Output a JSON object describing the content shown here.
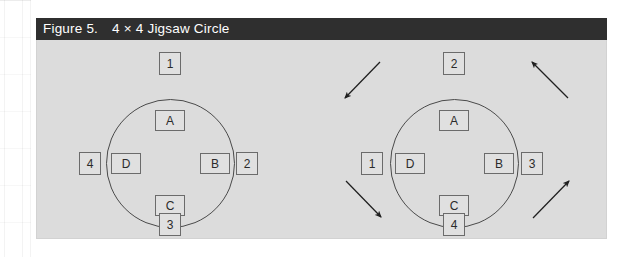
{
  "figure": {
    "label": "Figure 5.",
    "title": "4 × 4 Jigsaw Circle",
    "header_bg": "#2f2f2f",
    "header_fg": "#ffffff",
    "panel_bg": "#dcdcdc",
    "box_bg": "#e0e0e0",
    "line_color": "#4a4a4a"
  },
  "diagrams": [
    {
      "name": "before",
      "inner": {
        "top": "A",
        "right": "B",
        "bottom": "C",
        "left": "D"
      },
      "outer": {
        "top": "1",
        "right": "2",
        "bottom": "3",
        "left": "4"
      },
      "arrows": []
    },
    {
      "name": "after",
      "inner": {
        "top": "A",
        "right": "B",
        "bottom": "C",
        "left": "D"
      },
      "outer": {
        "top": "2",
        "right": "3",
        "bottom": "4",
        "left": "1"
      },
      "arrows": [
        {
          "position": "top-left",
          "direction": "down-left"
        },
        {
          "position": "top-right",
          "direction": "up-left"
        },
        {
          "position": "bottom-left",
          "direction": "down-right"
        },
        {
          "position": "bottom-right",
          "direction": "up-right"
        }
      ]
    }
  ]
}
